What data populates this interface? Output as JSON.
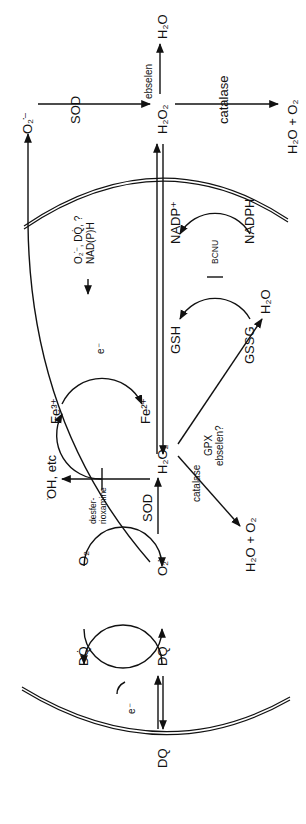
{
  "diagram": {
    "orientation": "rotated 90 degrees counterclockwise",
    "extracellular": {
      "o2_radical": "O₂̇⁻",
      "sod": "SOD",
      "h2o2": "H₂O₂",
      "ebselen": "ebselen",
      "h2o": "H₂O",
      "catalase": "catalase",
      "h2o_o2": "H₂O + O₂",
      "dq": "DQ"
    },
    "intracellular": {
      "dq_radical": "DQ̇",
      "dq": "DQ",
      "e_minus_1": "e⁻",
      "o2": "O₂",
      "o2_radical": "O₂̇⁻",
      "sod": "SOD",
      "h2o2": "H₂O₂",
      "catalase": "catalase",
      "h2o_o2": "H₂O + O₂",
      "gpx": "GPX",
      "ebselen_q": "ebselen?",
      "h2o": "H₂O",
      "oh_etc": "̇OH, etc",
      "fe3": "Fe³⁺",
      "fe2": "Fe²⁺",
      "e_minus_2": "e⁻",
      "desferrioxamine_1": "desfer-",
      "desferrioxamine_2": "rioxamine",
      "reductants_1": "O₂̇⁻, DQ̇, ?",
      "reductants_2": "NAD(P)H",
      "gsh": "GSH",
      "gssg": "GSSG",
      "bcnu": "BCNU",
      "nadp_plus": "NADP⁺",
      "nadph": "NADPH"
    }
  }
}
